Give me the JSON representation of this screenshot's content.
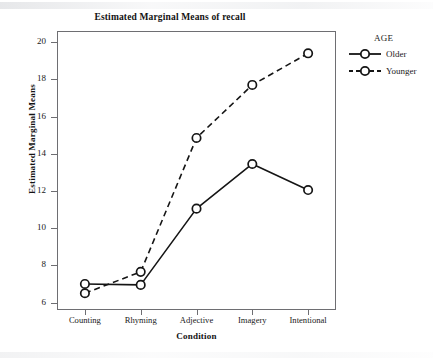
{
  "chart_data": {
    "type": "line",
    "title": "Estimated Marginal Means of recall",
    "xlabel": "Condition",
    "ylabel": "Estimated Marginal Means",
    "categories": [
      "Counting",
      "Rhyming",
      "Adjective",
      "Imagery",
      "Intentional"
    ],
    "series": [
      {
        "name": "Older",
        "values": [
          7.0,
          6.95,
          11.05,
          13.45,
          12.05
        ],
        "linestyle": "solid",
        "marker": "circle"
      },
      {
        "name": "Younger",
        "values": [
          6.5,
          7.65,
          14.85,
          17.7,
          19.4
        ],
        "linestyle": "dashed",
        "marker": "circle"
      }
    ],
    "ylim": [
      5.6,
      20.6
    ],
    "yticks": [
      6,
      8,
      10,
      12,
      14,
      16,
      18,
      20
    ],
    "ytick_labels": [
      "6",
      "8",
      "10",
      "12",
      "14",
      "16",
      "18",
      "20"
    ],
    "grid": false,
    "legend": {
      "title": "AGE",
      "position": "right",
      "entries": [
        "Older",
        "Younger"
      ]
    },
    "colors": {
      "line": "#151515",
      "frame": "#6e6e72",
      "background": "#ffffff"
    }
  },
  "legend": {
    "title": "AGE",
    "items": [
      {
        "label": "Older",
        "style": "solid"
      },
      {
        "label": "Younger",
        "style": "dashed"
      }
    ]
  }
}
